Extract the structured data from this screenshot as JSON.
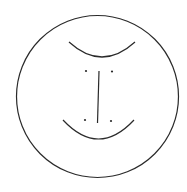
{
  "canvas": {
    "width": 187,
    "height": 192,
    "background": "#ffffff"
  },
  "stroke_color": "#2a2a2a",
  "face": {
    "outline": {
      "cx": 97.5,
      "cy": 96.5,
      "r": 81
    },
    "top_arc": {
      "x1": 69,
      "y1": 42,
      "x2": 135,
      "y2": 42,
      "cx": 102,
      "cy": 72
    },
    "bottom_arc": {
      "x1": 63,
      "y1": 120,
      "x2": 134,
      "y2": 120,
      "cx": 98.5,
      "cy": 158
    },
    "center_line": {
      "x1": 99,
      "y1": 71,
      "x2": 97.5,
      "y2": 123
    },
    "dots": [
      {
        "cx": 86,
        "cy": 71
      },
      {
        "cx": 112,
        "cy": 71.5
      },
      {
        "cx": 85,
        "cy": 120
      },
      {
        "cx": 111,
        "cy": 121
      }
    ]
  }
}
